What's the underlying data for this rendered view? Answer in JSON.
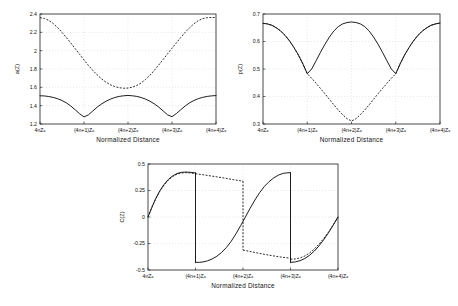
{
  "figure": {
    "background": "#ffffff",
    "ink": "#111111",
    "grid_color": "#c9c9c9"
  },
  "chart_data": [
    {
      "id": "panel-a",
      "type": "line",
      "title": "",
      "xlabel": "Normalized  Distance",
      "ylabel": "a(Z)",
      "xlim": [
        0,
        4
      ],
      "ylim": [
        1.2,
        2.4
      ],
      "xticklabels": [
        "4nZₐ",
        "(4n+1)Zₐ",
        "(4n+2)Zₐ",
        "(4n+3)Zₐ",
        "(4n+4)Zₐ"
      ],
      "xtickvalues": [
        0,
        1,
        2,
        3,
        4
      ],
      "yticklabels": [
        "1.2",
        "1.4",
        "1.6",
        "1.8",
        "2",
        "2.2",
        "2.4"
      ],
      "ytickvalues": [
        1.2,
        1.4,
        1.6,
        1.8,
        2.0,
        2.2,
        2.4
      ],
      "grid": true,
      "legend": "none",
      "series": [
        {
          "name": "solid",
          "style": "solid",
          "x": [
            0,
            0.1,
            0.2,
            0.3,
            0.4,
            0.5,
            0.6,
            0.7,
            0.8,
            0.9,
            1.0,
            1.1,
            1.2,
            1.3,
            1.4,
            1.5,
            1.6,
            1.7,
            1.8,
            1.9,
            2.0,
            2.1,
            2.2,
            2.3,
            2.4,
            2.5,
            2.6,
            2.7,
            2.8,
            2.9,
            3.0,
            3.1,
            3.2,
            3.3,
            3.4,
            3.5,
            3.6,
            3.7,
            3.8,
            3.9,
            4.0
          ],
          "y": [
            1.508,
            1.506,
            1.5,
            1.49,
            1.476,
            1.456,
            1.43,
            1.396,
            1.355,
            1.312,
            1.277,
            1.3,
            1.342,
            1.384,
            1.419,
            1.448,
            1.471,
            1.489,
            1.501,
            1.508,
            1.511,
            1.508,
            1.501,
            1.489,
            1.471,
            1.448,
            1.419,
            1.384,
            1.342,
            1.3,
            1.28,
            1.314,
            1.356,
            1.397,
            1.431,
            1.457,
            1.477,
            1.491,
            1.501,
            1.507,
            1.51
          ]
        },
        {
          "name": "dashed",
          "style": "dashed",
          "x": [
            0,
            0.1,
            0.2,
            0.3,
            0.4,
            0.5,
            0.6,
            0.7,
            0.8,
            0.9,
            1.0,
            1.1,
            1.2,
            1.3,
            1.4,
            1.5,
            1.6,
            1.7,
            1.8,
            1.9,
            2.0,
            2.1,
            2.2,
            2.3,
            2.4,
            2.5,
            2.6,
            2.7,
            2.8,
            2.9,
            3.0,
            3.1,
            3.2,
            3.3,
            3.4,
            3.5,
            3.6,
            3.7,
            3.8,
            3.9,
            4.0
          ],
          "y": [
            2.36,
            2.352,
            2.33,
            2.296,
            2.252,
            2.2,
            2.143,
            2.083,
            2.022,
            1.96,
            1.899,
            1.84,
            1.785,
            1.736,
            1.692,
            1.656,
            1.628,
            1.608,
            1.596,
            1.59,
            1.592,
            1.602,
            1.62,
            1.648,
            1.686,
            1.732,
            1.786,
            1.845,
            1.906,
            1.966,
            2.026,
            2.086,
            2.144,
            2.2,
            2.25,
            2.294,
            2.328,
            2.35,
            2.36,
            2.362,
            2.362
          ]
        }
      ]
    },
    {
      "id": "panel-b",
      "type": "line",
      "title": "",
      "xlabel": "Normalized  Distance",
      "ylabel": "p(Z)",
      "xlim": [
        0,
        4
      ],
      "ylim": [
        0.3,
        0.7
      ],
      "xticklabels": [
        "4nZₐ",
        "(4n+1)Zₐ",
        "(4n+2)Zₐ",
        "(4n+3)Zₐ",
        "(4n+4)Zₐ"
      ],
      "xtickvalues": [
        0,
        1,
        2,
        3,
        4
      ],
      "yticklabels": [
        "0.3",
        "0.4",
        "0.5",
        "0.6",
        "0.7"
      ],
      "ytickvalues": [
        0.3,
        0.4,
        0.5,
        0.6,
        0.7
      ],
      "grid": true,
      "legend": "none",
      "series": [
        {
          "name": "solid",
          "style": "solid",
          "x": [
            0,
            0.1,
            0.2,
            0.3,
            0.4,
            0.5,
            0.6,
            0.7,
            0.8,
            0.9,
            1.0,
            1.1,
            1.2,
            1.3,
            1.4,
            1.5,
            1.6,
            1.7,
            1.8,
            1.9,
            2.0,
            2.1,
            2.2,
            2.3,
            2.4,
            2.5,
            2.6,
            2.7,
            2.8,
            2.9,
            3.0,
            3.1,
            3.2,
            3.3,
            3.4,
            3.5,
            3.6,
            3.7,
            3.8,
            3.9,
            4.0
          ],
          "y": [
            0.666,
            0.664,
            0.659,
            0.65,
            0.638,
            0.622,
            0.602,
            0.578,
            0.551,
            0.519,
            0.483,
            0.5,
            0.53,
            0.561,
            0.59,
            0.616,
            0.638,
            0.654,
            0.664,
            0.669,
            0.671,
            0.669,
            0.664,
            0.654,
            0.638,
            0.616,
            0.59,
            0.561,
            0.53,
            0.5,
            0.483,
            0.519,
            0.551,
            0.578,
            0.602,
            0.622,
            0.638,
            0.65,
            0.659,
            0.664,
            0.667
          ]
        },
        {
          "name": "dashed",
          "style": "dashed",
          "x": [
            0,
            0.1,
            0.2,
            0.3,
            0.4,
            0.5,
            0.6,
            0.7,
            0.8,
            0.9,
            1.0,
            1.1,
            1.2,
            1.3,
            1.4,
            1.5,
            1.6,
            1.7,
            1.8,
            1.9,
            2.0,
            2.1,
            2.2,
            2.3,
            2.4,
            2.5,
            2.6,
            2.7,
            2.8,
            2.9,
            3.0,
            3.1,
            3.2,
            3.3,
            3.4,
            3.5,
            3.6,
            3.7,
            3.8,
            3.9,
            4.0
          ],
          "y": [
            0.666,
            0.664,
            0.659,
            0.65,
            0.638,
            0.622,
            0.602,
            0.578,
            0.551,
            0.519,
            0.483,
            0.466,
            0.448,
            0.429,
            0.41,
            0.39,
            0.37,
            0.351,
            0.334,
            0.319,
            0.311,
            0.319,
            0.334,
            0.351,
            0.37,
            0.39,
            0.41,
            0.429,
            0.448,
            0.466,
            0.483,
            0.519,
            0.551,
            0.578,
            0.602,
            0.622,
            0.638,
            0.65,
            0.659,
            0.664,
            0.667
          ]
        }
      ]
    },
    {
      "id": "panel-c",
      "type": "line",
      "title": "",
      "xlabel": "Normalized  Distance",
      "ylabel": "C(Z)",
      "xlim": [
        0,
        4
      ],
      "ylim": [
        -0.5,
        0.5
      ],
      "xticklabels": [
        "4nZₐ",
        "(4n+1)Zₐ",
        "(4n+2)Zₐ",
        "(4n+3)Zₐ",
        "(4n+4)Zₐ"
      ],
      "xtickvalues": [
        0,
        1,
        2,
        3,
        4
      ],
      "yticklabels": [
        "-0.5",
        "-0.25",
        "0",
        "0.25",
        "0.5"
      ],
      "ytickvalues": [
        -0.5,
        -0.25,
        0,
        0.25,
        0.5
      ],
      "grid": true,
      "legend": "none",
      "series": [
        {
          "name": "solid-seg1",
          "style": "solid",
          "x": [
            0,
            0.08,
            0.16,
            0.25,
            0.34,
            0.43,
            0.52,
            0.61,
            0.7,
            0.79,
            0.88,
            0.95,
            1.0
          ],
          "y": [
            0.0,
            0.09,
            0.172,
            0.248,
            0.308,
            0.355,
            0.388,
            0.41,
            0.421,
            0.424,
            0.422,
            0.419,
            0.416
          ]
        },
        {
          "name": "solid-drop1",
          "style": "solid",
          "x": [
            1.0,
            1.0
          ],
          "y": [
            0.416,
            -0.428
          ]
        },
        {
          "name": "solid-seg2",
          "style": "solid",
          "x": [
            1.0,
            1.08,
            1.16,
            1.25,
            1.35,
            1.45,
            1.55,
            1.65,
            1.75,
            1.85,
            1.95,
            2.05,
            2.15,
            2.25,
            2.35,
            2.45,
            2.55,
            2.65,
            2.75,
            2.85,
            2.92,
            3.0
          ],
          "y": [
            -0.428,
            -0.428,
            -0.424,
            -0.414,
            -0.396,
            -0.37,
            -0.334,
            -0.288,
            -0.23,
            -0.16,
            -0.082,
            0.0,
            0.082,
            0.16,
            0.23,
            0.288,
            0.334,
            0.37,
            0.396,
            0.412,
            0.416,
            0.418
          ]
        },
        {
          "name": "solid-drop2",
          "style": "solid",
          "x": [
            3.0,
            3.0
          ],
          "y": [
            0.418,
            -0.428
          ]
        },
        {
          "name": "solid-seg3",
          "style": "solid",
          "x": [
            3.0,
            3.1,
            3.2,
            3.3,
            3.4,
            3.5,
            3.6,
            3.7,
            3.8,
            3.9,
            4.0
          ],
          "y": [
            -0.428,
            -0.424,
            -0.412,
            -0.392,
            -0.362,
            -0.322,
            -0.272,
            -0.214,
            -0.148,
            -0.076,
            0.0
          ]
        },
        {
          "name": "dashed-seg1",
          "style": "dashed",
          "x": [
            0,
            0.08,
            0.16,
            0.25,
            0.34,
            0.43,
            0.52,
            0.61,
            0.7,
            0.79,
            0.88,
            0.95,
            1.0
          ],
          "y": [
            0.0,
            0.088,
            0.168,
            0.243,
            0.302,
            0.349,
            0.382,
            0.404,
            0.415,
            0.418,
            0.416,
            0.412,
            0.408
          ]
        },
        {
          "name": "dashed-plateau1",
          "style": "dashed",
          "x": [
            1.0,
            1.2,
            1.4,
            1.6,
            1.8,
            1.95,
            2.0
          ],
          "y": [
            0.408,
            0.396,
            0.382,
            0.368,
            0.352,
            0.342,
            0.338
          ]
        },
        {
          "name": "dashed-drop1",
          "style": "dashed",
          "x": [
            2.0,
            2.0
          ],
          "y": [
            0.338,
            -0.312
          ]
        },
        {
          "name": "dashed-plateau2",
          "style": "dashed",
          "x": [
            2.0,
            2.2,
            2.4,
            2.6,
            2.8,
            2.95,
            3.0
          ],
          "y": [
            -0.312,
            -0.33,
            -0.348,
            -0.364,
            -0.378,
            -0.386,
            -0.389
          ]
        },
        {
          "name": "dashed-drop2",
          "style": "dashed",
          "x": [
            3.0,
            3.0
          ],
          "y": [
            -0.389,
            -0.398
          ]
        },
        {
          "name": "dashed-seg3",
          "style": "dashed",
          "x": [
            3.0,
            3.1,
            3.2,
            3.3,
            3.4,
            3.5,
            3.6,
            3.7,
            3.8,
            3.9,
            4.0
          ],
          "y": [
            -0.398,
            -0.396,
            -0.386,
            -0.368,
            -0.34,
            -0.302,
            -0.256,
            -0.202,
            -0.142,
            -0.074,
            0.0
          ]
        }
      ]
    }
  ]
}
